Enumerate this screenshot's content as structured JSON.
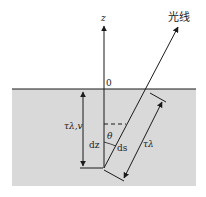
{
  "diagram": {
    "labels": {
      "z_axis": "z",
      "origin": "0",
      "ray": "光线",
      "tau_vertical": "τλ,v",
      "tau_slant": "τλ",
      "dz": "dz",
      "ds": "ds",
      "theta": "θ"
    },
    "colors": {
      "medium": "#d9d9d9",
      "line": "#1a1a1a",
      "background": "#ffffff"
    }
  }
}
